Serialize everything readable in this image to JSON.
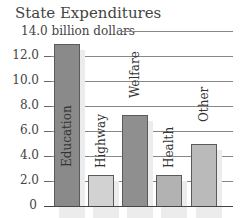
{
  "chart_data": {
    "type": "bar",
    "title": "State Expenditures",
    "ylabel": "billion dollars",
    "xlabel": "",
    "categories": [
      "Education",
      "Highway",
      "Welfare",
      "Health",
      "Other"
    ],
    "values": [
      13.0,
      2.5,
      7.3,
      2.5,
      5.0
    ],
    "ylim": [
      0,
      14.0
    ],
    "yticks": [
      "0",
      "2.0",
      "4.0",
      "6.0",
      "8.0",
      "10.0",
      "12.0",
      "14.0"
    ],
    "top_tick_label": "14.0 billion dollars",
    "grid": true,
    "legend": "none",
    "bar_colors": [
      "#8a8a8a",
      "#d2d2d2",
      "#8f8f8f",
      "#b2b2b2",
      "#bababa"
    ],
    "category_labels_inside_bars_rotated": true
  }
}
